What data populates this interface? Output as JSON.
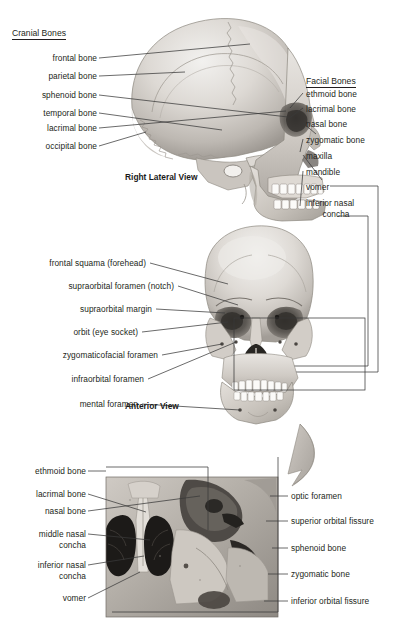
{
  "figure": {
    "title_cranial": "Cranial Bones",
    "title_facial": "Facial Bones",
    "caption_lateral": "Right Lateral View",
    "caption_anterior": "Anterior View",
    "line_color": "#3a3a3a",
    "text_color": "#231f20",
    "background": "#ffffff"
  },
  "panel_lateral": {
    "left_labels": [
      {
        "text": "frontal bone"
      },
      {
        "text": "parietal bone"
      },
      {
        "text": "sphenoid bone"
      },
      {
        "text": "temporal bone"
      },
      {
        "text": "lacrimal bone"
      },
      {
        "text": "occipital bone"
      }
    ],
    "right_labels": [
      {
        "text": "ethmoid bone"
      },
      {
        "text": "lacrimal bone"
      },
      {
        "text": "nasal bone"
      },
      {
        "text": "zygomatic bone"
      },
      {
        "text": "maxilla"
      },
      {
        "text": "mandible"
      },
      {
        "text": "vomer"
      },
      {
        "text": "inferior nasal"
      },
      {
        "text": "concha"
      }
    ]
  },
  "panel_anterior": {
    "left_labels": [
      {
        "text": "frontal squama (forehead)"
      },
      {
        "text": "supraorbital foramen (notch)"
      },
      {
        "text": "supraorbital margin"
      },
      {
        "text": "orbit (eye socket)"
      },
      {
        "text": "zygomaticofacial foramen"
      },
      {
        "text": "infraorbital foramen"
      },
      {
        "text": "mental foramen"
      }
    ]
  },
  "panel_detail": {
    "left_labels": [
      {
        "text": "ethmoid bone"
      },
      {
        "text": "lacrimal bone"
      },
      {
        "text": "nasal bone"
      },
      {
        "text": "middle nasal"
      },
      {
        "text": "concha"
      },
      {
        "text": "inferior nasal"
      },
      {
        "text": "concha"
      },
      {
        "text": "vomer"
      }
    ],
    "right_labels": [
      {
        "text": "optic foramen"
      },
      {
        "text": "superior orbital fissure"
      },
      {
        "text": "sphenoid bone"
      },
      {
        "text": "zygomatic bone"
      },
      {
        "text": "inferior orbital fissure"
      }
    ]
  }
}
